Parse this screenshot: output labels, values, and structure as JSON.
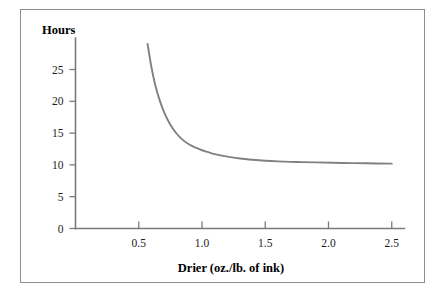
{
  "chart_data": {
    "type": "line",
    "title": "",
    "xlabel": "Drier (oz./lb. of ink)",
    "ylabel": "Hours",
    "xlim": [
      0,
      2.6
    ],
    "ylim": [
      0,
      29.5
    ],
    "grid": false,
    "legend": null,
    "series_color": "#818181",
    "xticks": [
      0.5,
      1.0,
      1.5,
      2.0,
      2.5
    ],
    "xticklabels": [
      "0.5",
      "1.0",
      "1.5",
      "2.0",
      "2.5"
    ],
    "yticks": [
      0,
      5,
      10,
      15,
      20,
      25
    ],
    "yticklabels": [
      "0",
      "5",
      "10",
      "15",
      "20",
      "25"
    ],
    "series": [
      {
        "name": "Drying time",
        "x": [
          0.57,
          0.6,
          0.63,
          0.66,
          0.7,
          0.75,
          0.8,
          0.85,
          0.9,
          0.95,
          1.0,
          1.05,
          1.1,
          1.2,
          1.3,
          1.4,
          1.5,
          1.6,
          1.75,
          1.9,
          2.1,
          2.3,
          2.5
        ],
        "y": [
          29.0,
          25.4,
          22.6,
          20.5,
          18.3,
          16.3,
          14.9,
          13.9,
          13.2,
          12.7,
          12.3,
          12.0,
          11.7,
          11.3,
          11.0,
          10.8,
          10.65,
          10.55,
          10.45,
          10.4,
          10.3,
          10.25,
          10.2
        ]
      }
    ]
  },
  "figure": {
    "ylabel_text": "Hours",
    "xlabel_text": "Drier (oz./lb. of ink)"
  }
}
